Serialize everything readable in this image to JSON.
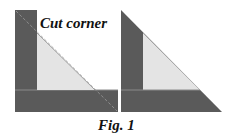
{
  "figure": {
    "label_top": "Cut corner",
    "caption": "Fig. 1",
    "colors": {
      "dark": "#5a5a5a",
      "light": "#e4e4e4",
      "background": "#ffffff"
    },
    "panels": [
      {
        "name": "left",
        "description": "square with L-shaped dark strips and light triangle, dashed cut line across corner"
      },
      {
        "name": "right",
        "description": "corner cut off leaving triangle with dark strips and light inner triangle"
      }
    ]
  }
}
